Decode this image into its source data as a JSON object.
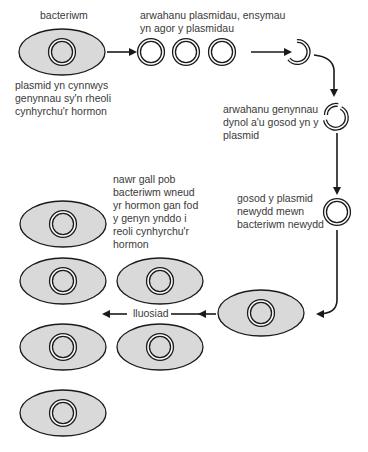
{
  "labels": {
    "bacterium": "bacteriwm",
    "plasmid_desc": [
      "plasmid yn cynnwys",
      "genynnau sy'n rheoli",
      "cynhyrchu'r hormon"
    ],
    "isolate_plasmids": [
      "arwahanu plasmidau, ensymau",
      "yn agor y plasmidau"
    ],
    "isolate_genes": [
      "arwahanu genynnau",
      "dynol a'u gosod yn y",
      "plasmid"
    ],
    "insert_plasmid": [
      "gosod y plasmid",
      "newydd mewn",
      "bacteriwm newydd"
    ],
    "result": [
      "nawr gall pob",
      "bacteriwm wneud",
      "yr hormon gan fod",
      "y genyn ynddo i",
      "reoli cynhyrchu'r",
      "hormon"
    ],
    "multiply": "lluosiad"
  },
  "colors": {
    "cell_fill": "#d9d9d9",
    "stroke": "#1a1a1a",
    "text": "#3a3a3a"
  }
}
